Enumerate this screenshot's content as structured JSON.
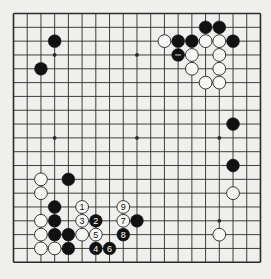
{
  "board": {
    "size": 19,
    "origin_x": 13.5,
    "origin_y": 13.5,
    "step_x": 13.72,
    "step_y": 13.82,
    "stone_radius": 6.4,
    "colors": {
      "background": "#efefed",
      "line": "#2b2b2b",
      "black_stone": "#111111",
      "white_stone": "#f7f7f5",
      "white_stone_edge": "#222222"
    },
    "hoshi": [
      [
        3,
        3
      ],
      [
        9,
        3
      ],
      [
        15,
        3
      ],
      [
        3,
        9
      ],
      [
        9,
        9
      ],
      [
        15,
        9
      ],
      [
        3,
        15
      ],
      [
        9,
        15
      ],
      [
        15,
        15
      ]
    ],
    "stones": [
      {
        "col": 3,
        "row": 2,
        "color": "black"
      },
      {
        "col": 2,
        "row": 4,
        "color": "black"
      },
      {
        "col": 14,
        "row": 1,
        "color": "black"
      },
      {
        "col": 15,
        "row": 1,
        "color": "black"
      },
      {
        "col": 11,
        "row": 2,
        "color": "white"
      },
      {
        "col": 12,
        "row": 2,
        "color": "black"
      },
      {
        "col": 13,
        "row": 2,
        "color": "black"
      },
      {
        "col": 14,
        "row": 2,
        "color": "white"
      },
      {
        "col": 15,
        "row": 2,
        "color": "white"
      },
      {
        "col": 16,
        "row": 2,
        "color": "black"
      },
      {
        "col": 12,
        "row": 3,
        "color": "black",
        "mark": "dash"
      },
      {
        "col": 13,
        "row": 3,
        "color": "white"
      },
      {
        "col": 15,
        "row": 3,
        "color": "white"
      },
      {
        "col": 13,
        "row": 4,
        "color": "white"
      },
      {
        "col": 15,
        "row": 4,
        "color": "white"
      },
      {
        "col": 14,
        "row": 5,
        "color": "white"
      },
      {
        "col": 15,
        "row": 5,
        "color": "white"
      },
      {
        "col": 16,
        "row": 8,
        "color": "black"
      },
      {
        "col": 16,
        "row": 11,
        "color": "black"
      },
      {
        "col": 16,
        "row": 13,
        "color": "white"
      },
      {
        "col": 15,
        "row": 16,
        "color": "white"
      },
      {
        "col": 2,
        "row": 12,
        "color": "white"
      },
      {
        "col": 4,
        "row": 12,
        "color": "black"
      },
      {
        "col": 2,
        "row": 13,
        "color": "white"
      },
      {
        "col": 3,
        "row": 14,
        "color": "black"
      },
      {
        "col": 2,
        "row": 15,
        "color": "white"
      },
      {
        "col": 3,
        "row": 15,
        "color": "black"
      },
      {
        "col": 2,
        "row": 16,
        "color": "white"
      },
      {
        "col": 3,
        "row": 16,
        "color": "black"
      },
      {
        "col": 4,
        "row": 16,
        "color": "black"
      },
      {
        "col": 5,
        "row": 16,
        "color": "white"
      },
      {
        "col": 2,
        "row": 17,
        "color": "white"
      },
      {
        "col": 3,
        "row": 17,
        "color": "white"
      },
      {
        "col": 4,
        "row": 17,
        "color": "black"
      },
      {
        "col": 9,
        "row": 15,
        "color": "black"
      },
      {
        "col": 5,
        "row": 14,
        "color": "white",
        "label": "1"
      },
      {
        "col": 6,
        "row": 15,
        "color": "black",
        "label": "2"
      },
      {
        "col": 5,
        "row": 15,
        "color": "white",
        "label": "3"
      },
      {
        "col": 6,
        "row": 17,
        "color": "black",
        "label": "4"
      },
      {
        "col": 6,
        "row": 16,
        "color": "white",
        "label": "5"
      },
      {
        "col": 7,
        "row": 17,
        "color": "black",
        "label": "6"
      },
      {
        "col": 8,
        "row": 15,
        "color": "white",
        "label": "7"
      },
      {
        "col": 8,
        "row": 16,
        "color": "black",
        "label": "8"
      },
      {
        "col": 8,
        "row": 14,
        "color": "white",
        "label": "9"
      }
    ]
  }
}
